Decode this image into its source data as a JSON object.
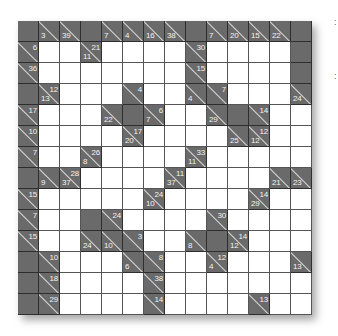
{
  "puzzle": {
    "type": "kakuro",
    "rows": 14,
    "cols": 14,
    "legend": {
      "B": "blank black cell",
      "W": "empty white cell",
      "clue": "d = down sum (lower-left), a = across sum (upper-right)"
    },
    "grid": [
      [
        "B",
        {
          "d": 3
        },
        {
          "d": 39
        },
        "B",
        {
          "d": 7
        },
        {
          "d": 4
        },
        {
          "d": 16
        },
        {
          "d": 38
        },
        "B",
        {
          "d": 7
        },
        {
          "d": 20
        },
        {
          "d": 15
        },
        {
          "d": 22
        },
        "B"
      ],
      [
        {
          "a": 6
        },
        "W",
        "W",
        {
          "d": 11,
          "a": 21
        },
        "W",
        "W",
        "W",
        "W",
        {
          "a": 30
        },
        "W",
        "W",
        "W",
        "W",
        "B"
      ],
      [
        {
          "a": 36
        },
        "W",
        "W",
        "W",
        "W",
        "W",
        "W",
        "W",
        {
          "a": 15
        },
        "W",
        "W",
        "W",
        "W",
        "B"
      ],
      [
        "B",
        {
          "d": 13,
          "a": 12
        },
        "W",
        "W",
        "W",
        {
          "a": 4
        },
        "W",
        "W",
        {
          "d": 4
        },
        {
          "a": 7
        },
        "W",
        "W",
        "W",
        {
          "d": 24
        }
      ],
      [
        {
          "a": 17
        },
        "W",
        "W",
        "W",
        {
          "d": 22
        },
        "B",
        {
          "d": 7,
          "a": 6
        },
        "W",
        "W",
        {
          "d": 29
        },
        "B",
        {
          "a": 14
        },
        "W",
        "W"
      ],
      [
        {
          "a": 10
        },
        "W",
        "W",
        "W",
        "W",
        {
          "d": 20,
          "a": 17
        },
        "W",
        "W",
        "W",
        "W",
        {
          "d": 25
        },
        {
          "d": 12,
          "a": 12
        },
        "W",
        "W"
      ],
      [
        {
          "a": 7
        },
        "W",
        "W",
        {
          "d": 8,
          "a": 26
        },
        "W",
        "W",
        "W",
        "W",
        {
          "d": 11,
          "a": 33
        },
        "W",
        "W",
        "W",
        "W",
        "W"
      ],
      [
        "B",
        {
          "d": 9
        },
        {
          "d": 37,
          "a": 28
        },
        "W",
        "W",
        "W",
        "W",
        {
          "d": 37,
          "a": 11
        },
        "W",
        "W",
        "W",
        "W",
        {
          "d": 21
        },
        {
          "d": 23
        }
      ],
      [
        {
          "a": 15
        },
        "W",
        "W",
        "W",
        "W",
        "W",
        {
          "d": 10,
          "a": 24
        },
        "W",
        "W",
        "W",
        "W",
        {
          "d": 29,
          "a": 14
        },
        "W",
        "W"
      ],
      [
        {
          "a": 7
        },
        "W",
        "W",
        "B",
        {
          "a": 24
        },
        "W",
        "W",
        "W",
        "W",
        {
          "a": 30
        },
        "W",
        "W",
        "W",
        "W"
      ],
      [
        {
          "a": 15
        },
        "W",
        "W",
        {
          "d": 24
        },
        {
          "d": 10
        },
        {
          "a": 3
        },
        "W",
        "W",
        {
          "d": 8
        },
        "B",
        {
          "d": 12,
          "a": 14
        },
        "W",
        "W",
        "W"
      ],
      [
        "B",
        {
          "a": 10
        },
        "W",
        "W",
        "W",
        {
          "d": 6
        },
        {
          "a": 8
        },
        "W",
        "W",
        {
          "d": 4,
          "a": 12
        },
        "W",
        "W",
        "W",
        {
          "d": 13
        }
      ],
      [
        "B",
        {
          "a": 18
        },
        "W",
        "W",
        "W",
        "W",
        {
          "a": 38
        },
        "W",
        "W",
        "W",
        "W",
        "W",
        "W",
        "W"
      ],
      [
        "B",
        {
          "a": 29
        },
        "W",
        "W",
        "W",
        "W",
        {
          "a": 14
        },
        "W",
        "W",
        "W",
        "W",
        {
          "a": 13
        },
        "W",
        "W"
      ]
    ]
  },
  "side_marks": [
    ":",
    ":"
  ],
  "colors": {
    "block": "#6a6a6a",
    "white": "#ffffff",
    "grid_line": "#2e2e2e",
    "clue_text": "#f2f2f2"
  }
}
